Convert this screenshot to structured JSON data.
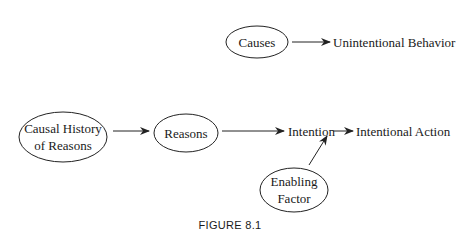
{
  "diagram": {
    "caption": "FIGURE 8.1",
    "nodes": {
      "causes": {
        "label": "Causes",
        "shape": "ellipse"
      },
      "unintentional_behavior": {
        "label": "Unintentional Behavior",
        "shape": "text"
      },
      "causal_history": {
        "line1": "Causal History",
        "line2": "of Reasons",
        "shape": "ellipse"
      },
      "reasons": {
        "label": "Reasons",
        "shape": "ellipse"
      },
      "intention": {
        "label": "Intention",
        "shape": "text"
      },
      "intentional_action": {
        "label": "Intentional Action",
        "shape": "text"
      },
      "enabling_factor": {
        "line1": "Enabling",
        "line2": "Factor",
        "shape": "ellipse"
      }
    },
    "edges": [
      {
        "from": "Causes",
        "to": "Unintentional Behavior"
      },
      {
        "from": "Causal History of Reasons",
        "to": "Reasons"
      },
      {
        "from": "Reasons",
        "to": "Intention"
      },
      {
        "from": "Intention",
        "to": "Intentional Action"
      },
      {
        "from": "Enabling Factor",
        "to": "Intention → Intentional Action edge"
      }
    ],
    "colors": {
      "ink": "#222222",
      "background": "#ffffff"
    }
  }
}
